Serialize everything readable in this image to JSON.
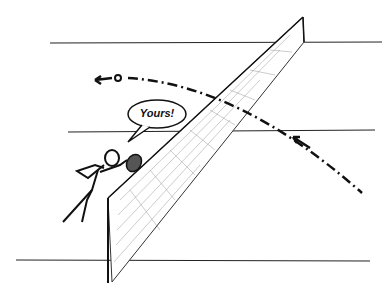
{
  "illustration": {
    "subject": "tennis doubles net play",
    "speech_bubble": {
      "text": "Yours!"
    },
    "colors": {
      "ink": "#111111",
      "background": "#ffffff",
      "net_shade": "#888888"
    }
  }
}
